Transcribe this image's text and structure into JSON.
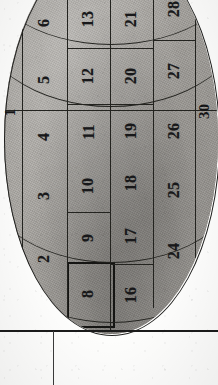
{
  "plate": {
    "title": "Numbered oval diagram plate",
    "orientation": "rotated-90-ccw",
    "shape": "oval",
    "fill_color": "#a8a5a0",
    "line_color": "#23231f",
    "text_color": "#18181a",
    "paper_color": "#fdfdfc",
    "axis_labels": {
      "left": "1",
      "right": "30"
    },
    "columns": [
      {
        "index": 0,
        "cells": [
          {
            "label": "7",
            "clipped": true
          },
          {
            "label": "6",
            "clipped": false
          },
          {
            "label": "5",
            "clipped": false
          },
          {
            "label": "4",
            "clipped": false
          },
          {
            "label": "3",
            "clipped": false
          },
          {
            "label": "2",
            "clipped": false
          }
        ]
      },
      {
        "index": 1,
        "cells": [
          {
            "label": "14",
            "clipped": true
          },
          {
            "label": "13",
            "clipped": false
          },
          {
            "label": "12",
            "clipped": false
          },
          {
            "label": "11",
            "clipped": false
          },
          {
            "label": "10",
            "clipped": false
          },
          {
            "label": "9",
            "clipped": false
          },
          {
            "label": "8",
            "clipped": false,
            "emphasized": true
          }
        ]
      },
      {
        "index": 2,
        "cells": [
          {
            "label": "22",
            "clipped": true
          },
          {
            "label": "21",
            "clipped": false
          },
          {
            "label": "20",
            "clipped": false
          },
          {
            "label": "19",
            "clipped": false
          },
          {
            "label": "18",
            "clipped": false
          },
          {
            "label": "17",
            "clipped": false
          },
          {
            "label": "16",
            "clipped": false
          }
        ]
      },
      {
        "index": 3,
        "cells": [
          {
            "label": "28",
            "clipped": false
          },
          {
            "label": "27",
            "clipped": false
          },
          {
            "label": "26",
            "clipped": false
          },
          {
            "label": "25",
            "clipped": false
          },
          {
            "label": "24",
            "clipped": false
          }
        ]
      }
    ],
    "all_numbers": [
      "1",
      "2",
      "3",
      "4",
      "5",
      "6",
      "7",
      "8",
      "9",
      "10",
      "11",
      "12",
      "13",
      "14",
      "16",
      "17",
      "18",
      "19",
      "20",
      "21",
      "22",
      "24",
      "25",
      "26",
      "27",
      "28",
      "30"
    ]
  },
  "ruled_area": {
    "horizontal_rule_count": 1,
    "vertical_rule_count": 1,
    "rule_color": "#1b1b1b"
  }
}
